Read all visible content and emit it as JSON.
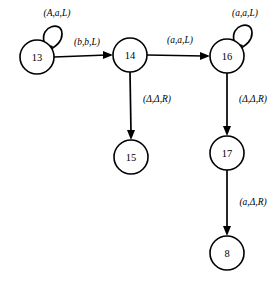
{
  "diagram": {
    "type": "state-transition-diagram",
    "background_color": "#ffffff",
    "stroke_color": "#000000",
    "nodes": [
      {
        "id": "13",
        "label": "13",
        "cx": 37,
        "cy": 57,
        "r": 17
      },
      {
        "id": "14",
        "label": "14",
        "cx": 130,
        "cy": 55,
        "r": 17
      },
      {
        "id": "16",
        "label": "16",
        "cx": 227,
        "cy": 56,
        "r": 17
      },
      {
        "id": "15",
        "label": "15",
        "cx": 131,
        "cy": 157,
        "r": 17
      },
      {
        "id": "17",
        "label": "17",
        "cx": 227,
        "cy": 153,
        "r": 17
      },
      {
        "id": "8",
        "label": "8",
        "cx": 227,
        "cy": 253,
        "r": 17
      }
    ],
    "edges": [
      {
        "id": "e-13-13",
        "from": "13",
        "to": "13",
        "kind": "self-loop",
        "label": "(A,a,L)",
        "label_x": 57,
        "label_y": 13
      },
      {
        "id": "e-13-14",
        "from": "13",
        "to": "14",
        "kind": "straight",
        "label": "(b,b,L)",
        "label_x": 87,
        "label_y": 42
      },
      {
        "id": "e-14-16",
        "from": "14",
        "to": "16",
        "kind": "straight",
        "label": "(a,a,L)",
        "label_x": 180,
        "label_y": 40
      },
      {
        "id": "e-16-16",
        "from": "16",
        "to": "16",
        "kind": "self-loop",
        "label": "(a,a,L)",
        "label_x": 245,
        "label_y": 13
      },
      {
        "id": "e-14-15",
        "from": "14",
        "to": "15",
        "kind": "straight",
        "label": "(Δ,Δ,R)",
        "label_x": 157,
        "label_y": 99
      },
      {
        "id": "e-16-17",
        "from": "16",
        "to": "17",
        "kind": "straight",
        "label": "(Δ,Δ,R)",
        "label_x": 253,
        "label_y": 99
      },
      {
        "id": "e-17-8",
        "from": "17",
        "to": "8",
        "kind": "straight",
        "label": "(a,Δ,R)",
        "label_x": 253,
        "label_y": 202
      }
    ]
  }
}
